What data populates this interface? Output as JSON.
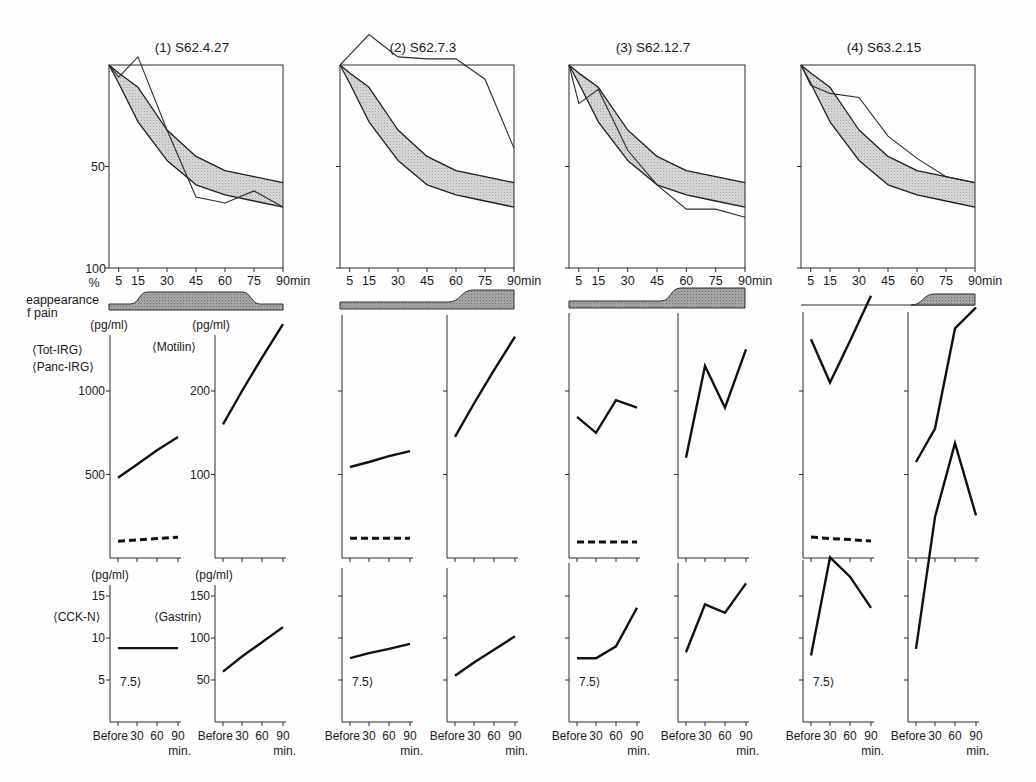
{
  "chart_data": {
    "type": "line",
    "title": "",
    "emptying": {
      "x": [
        0,
        5,
        15,
        30,
        45,
        60,
        75,
        90
      ],
      "x_tick_values": [
        5,
        15,
        30,
        45,
        60,
        75,
        90
      ],
      "x_tick_labels": [
        "5",
        "15",
        "30",
        "45",
        "60",
        "75",
        "90"
      ],
      "x_unit": "min",
      "y_tick_values": [
        50,
        100
      ],
      "y_tick_labels": [
        "50",
        "100"
      ],
      "y_unit": "%",
      "ylim": [
        0,
        100
      ],
      "y_inverted": true,
      "grid": false,
      "normal_range": {
        "upper": [
          0,
          4,
          11,
          32,
          45,
          52,
          55,
          58
        ],
        "lower": [
          0,
          9,
          28,
          47,
          59,
          64,
          67,
          70
        ]
      }
    },
    "pain_label": {
      "line1": "eappearance",
      "line2": "f pain"
    },
    "hormone_x": {
      "x": [
        0,
        30,
        60,
        90
      ],
      "tick_labels": [
        "Before",
        "30",
        "60",
        "90"
      ],
      "unit": "min."
    },
    "panels": {
      "irg": {
        "unit": "(pg/ml)",
        "series_labels": [
          "⟨Tot-IRG⟩",
          "⟨Panc-IRG⟩"
        ],
        "tick_values": [
          1000,
          500
        ],
        "tick_labels": [
          "1000",
          "500"
        ]
      },
      "motilin": {
        "unit": "(pg/ml)",
        "label": "⟨Motilin⟩",
        "tick_values": [
          200,
          100
        ],
        "tick_labels": [
          "200",
          "100"
        ]
      },
      "cck_n": {
        "unit": "(pg/ml)",
        "label": "⟨CCK-N⟩",
        "tick_values": [
          15,
          10,
          5
        ],
        "tick_labels": [
          "15",
          "10",
          "5"
        ],
        "detection_limit_note": "7.5⟩"
      },
      "gastrin": {
        "unit": "(pg/ml)",
        "label": "⟨Gastrin⟩",
        "tick_values": [
          150,
          100,
          50
        ],
        "tick_labels": [
          "150",
          "100",
          "50"
        ]
      }
    },
    "cases": [
      {
        "title": "(1) S62.4.27",
        "emptying_patient": [
          0,
          6,
          -4,
          32,
          65,
          68,
          62,
          70
        ],
        "pain": {
          "baseline": true,
          "rise": [
            11,
            20
          ],
          "fall": [
            69,
            78
          ]
        },
        "tot_irg": [
          480,
          560,
          645,
          725
        ],
        "panc_irg": [
          100,
          108,
          116,
          124
        ],
        "motilin": [
          160,
          200,
          240,
          280
        ],
        "cck_n": [
          8.8,
          8.8,
          8.8,
          8.8
        ],
        "gastrin": [
          60,
          78,
          95,
          113
        ]
      },
      {
        "title": "(2) S62.7.3",
        "emptying_patient": [
          0,
          -5,
          -15,
          -4,
          -3,
          -3,
          7,
          41
        ],
        "pain": {
          "baseline": true,
          "rise": [
            56,
            69
          ],
          "fall": null
        },
        "tot_irg": [
          545,
          575,
          610,
          640
        ],
        "panc_irg": [
          118,
          118,
          118,
          118
        ],
        "motilin": [
          145,
          185,
          225,
          265
        ],
        "cck_n": [
          7.6,
          8.2,
          8.7,
          9.3
        ],
        "gastrin": [
          55,
          71,
          86,
          102
        ]
      },
      {
        "title": "(3) S62.12.7",
        "emptying_patient": [
          0,
          19,
          12,
          42,
          59,
          71,
          71,
          75
        ],
        "pain": {
          "baseline": true,
          "rise": [
            47,
            57
          ],
          "fall": null
        },
        "tot_irg": [
          845,
          750,
          945,
          900
        ],
        "panc_irg": [
          95,
          95,
          95,
          95
        ],
        "motilin": [
          120,
          230,
          180,
          250
        ],
        "cck_n": [
          7.6,
          7.6,
          9.0,
          13.6
        ],
        "gastrin": [
          83,
          140,
          130,
          165
        ]
      },
      {
        "title": "(4) S63.2.15",
        "emptying_patient": [
          0,
          10,
          14,
          16,
          35,
          46,
          55,
          58
        ],
        "pain": {
          "baseline": false,
          "rise": [
            57,
            69
          ],
          "fall": null
        },
        "tot_irg": [
          1310,
          1050,
          1300,
          1570
        ],
        "panc_irg": [
          125,
          117,
          110,
          102
        ],
        "motilin": [
          115,
          155,
          275,
          300
        ],
        "cck_n": [
          7.9,
          19.6,
          17.3,
          13.6
        ],
        "gastrin": [
          87,
          244,
          332,
          246
        ]
      }
    ]
  }
}
